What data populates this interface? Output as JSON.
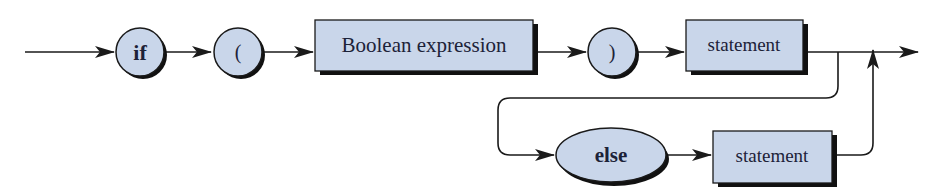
{
  "diagram": {
    "type": "syntax-diagram",
    "colors": {
      "node_fill": "#c9d6ea",
      "node_stroke": "#1a1a1a",
      "shadow": "#111111",
      "line": "#1a1a1a",
      "text": "#1c2238"
    },
    "nodes": [
      {
        "id": "if",
        "shape": "circle",
        "label": "if",
        "bold": true,
        "kind": "terminal"
      },
      {
        "id": "lparen",
        "shape": "circle",
        "label": "(",
        "bold": false,
        "kind": "terminal"
      },
      {
        "id": "boolexpr",
        "shape": "rectangle",
        "label": "Boolean expression",
        "kind": "nonterminal"
      },
      {
        "id": "rparen",
        "shape": "circle",
        "label": ")",
        "bold": false,
        "kind": "terminal"
      },
      {
        "id": "stmt1",
        "shape": "rectangle",
        "label": "statement",
        "kind": "nonterminal"
      },
      {
        "id": "else",
        "shape": "ellipse",
        "label": "else",
        "bold": true,
        "kind": "terminal"
      },
      {
        "id": "stmt2",
        "shape": "rectangle",
        "label": "statement",
        "kind": "nonterminal"
      }
    ],
    "edges": [
      {
        "from": "start",
        "to": "if"
      },
      {
        "from": "if",
        "to": "lparen"
      },
      {
        "from": "lparen",
        "to": "boolexpr"
      },
      {
        "from": "boolexpr",
        "to": "rparen"
      },
      {
        "from": "rparen",
        "to": "stmt1"
      },
      {
        "from": "stmt1",
        "to": "end"
      },
      {
        "from": "stmt1",
        "to": "else",
        "note": "optional branch loops down"
      },
      {
        "from": "else",
        "to": "stmt2"
      },
      {
        "from": "stmt2",
        "to": "end",
        "note": "rejoins main line from below"
      }
    ]
  }
}
